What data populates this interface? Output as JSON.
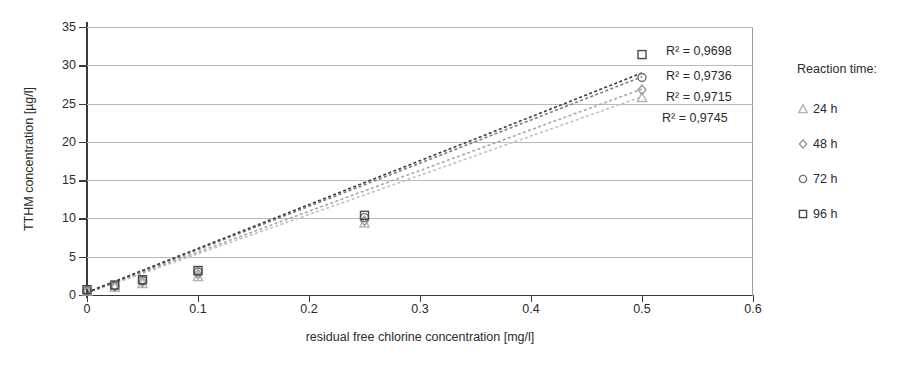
{
  "chart_data": {
    "type": "scatter",
    "title": "",
    "xlabel": "residual free chlorine concentration [mg/l]",
    "ylabel": "TTHM concentration [µg/l]",
    "xlim": [
      0,
      0.6
    ],
    "ylim": [
      0,
      35
    ],
    "xticks": [
      "0",
      "0.1",
      "0.2",
      "0.3",
      "0.4",
      "0.5",
      "0.6"
    ],
    "xtick_values": [
      0,
      0.1,
      0.2,
      0.3,
      0.4,
      0.5,
      0.6
    ],
    "yticks": [
      "0",
      "5",
      "10",
      "15",
      "20",
      "25",
      "30",
      "35"
    ],
    "ytick_values": [
      0,
      5,
      10,
      15,
      20,
      25,
      30,
      35
    ],
    "grid": "horizontal",
    "legend_position": "right",
    "x": [
      0,
      0.025,
      0.05,
      0.1,
      0.25,
      0.5
    ],
    "series": [
      {
        "name": "24 h",
        "marker": "triangle",
        "color": "#b4b4b4",
        "values": [
          0.5,
          1.0,
          1.5,
          2.4,
          9.4,
          25.8
        ],
        "trend_color": "#c0c0c0",
        "trend_y0": 0.25,
        "trend_y1": 25.9,
        "r2_label": "R² = 0,9745"
      },
      {
        "name": "48 h",
        "marker": "diamond",
        "color": "#9a9a9a",
        "values": [
          0.55,
          1.1,
          1.7,
          2.7,
          9.7,
          26.8
        ],
        "trend_color": "#a8a8a8",
        "trend_y0": 0.3,
        "trend_y1": 26.9,
        "r2_label": "R² = 0,9715"
      },
      {
        "name": "72 h",
        "marker": "circle",
        "color": "#6e6e6e",
        "values": [
          0.6,
          1.2,
          1.9,
          3.0,
          10.1,
          28.4
        ],
        "trend_color": "#7d7d7d",
        "trend_y0": 0.3,
        "trend_y1": 28.5,
        "r2_label": "R² = 0,9736"
      },
      {
        "name": "96 h",
        "marker": "square",
        "color": "#4a4a4a",
        "values": [
          0.7,
          1.3,
          2.0,
          3.2,
          10.4,
          31.4
        ],
        "trend_color": "#3c3c3c",
        "trend_y0": 0.35,
        "trend_y1": 29.0,
        "r2_label": "R² = 0,9698"
      }
    ],
    "r2_annotations": [
      {
        "text": "R² = 0,9698",
        "series": "96 h"
      },
      {
        "text": "R² = 0,9736",
        "series": "72 h"
      },
      {
        "text": "R² = 0,9715",
        "series": "48 h"
      },
      {
        "text": "R² = 0,9745",
        "series": "24 h"
      }
    ]
  },
  "legend": {
    "title": "Reaction time:",
    "items": [
      {
        "label": "24 h",
        "marker": "triangle"
      },
      {
        "label": "48 h",
        "marker": "diamond"
      },
      {
        "label": "72 h",
        "marker": "circle"
      },
      {
        "label": "96 h",
        "marker": "square"
      }
    ]
  },
  "colors": {
    "axis": "#3a3a3a",
    "grid": "#b9b9b9",
    "frame": "#9a9a9a",
    "text": "#2b2b2b",
    "background": "#ffffff"
  }
}
